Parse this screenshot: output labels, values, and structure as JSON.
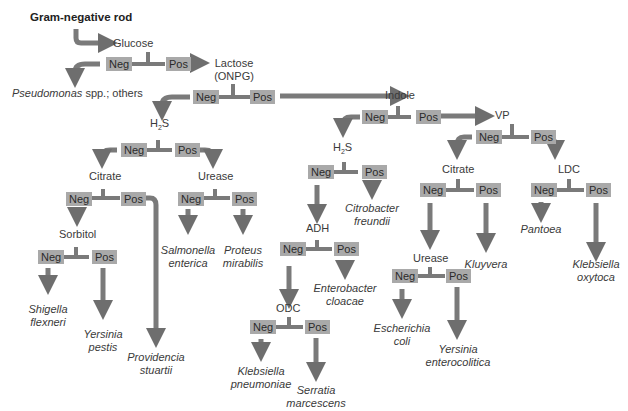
{
  "title": "Gram-negative rod",
  "colors": {
    "badge": "#a9a9a9",
    "arrow": "#6e6e6e",
    "text": "#3a3a3a"
  },
  "labels": {
    "neg": "Neg",
    "pos": "Pos"
  },
  "tests": {
    "glucose": "Glucose",
    "lactose1": "Lactose",
    "lactose2": "(ONPG)",
    "h2s_a": "H",
    "h2s_sub": "2",
    "h2s_b": "S",
    "citrate": "Citrate",
    "urease": "Urease",
    "sorbitol": "Sorbitol",
    "indole": "Indole",
    "vp": "VP",
    "adh": "ADH",
    "odc": "ODC",
    "ldc": "LDC"
  },
  "outcomes": {
    "pseudomonas_italic": "Pseudomonas",
    "pseudomonas_rest": " spp.; others",
    "salmonella": [
      "Salmonella",
      "enterica"
    ],
    "proteus": [
      "Proteus",
      "mirabilis"
    ],
    "shigella": [
      "Shigella",
      "flexneri"
    ],
    "yersinia_pestis": [
      "Yersinia",
      "pestis"
    ],
    "providencia": [
      "Providencia",
      "stuartii"
    ],
    "citrobacter": [
      "Citrobacter",
      "freundii"
    ],
    "enterobacter": [
      "Enterobacter",
      "cloacae"
    ],
    "klebsiella_pn": [
      "Klebsiella",
      "pneumoniae"
    ],
    "serratia": [
      "Serratia",
      "marcescens"
    ],
    "escherichia": [
      "Escherichia",
      "coli"
    ],
    "yersinia_ent": [
      "Yersinia",
      "enterocolitica"
    ],
    "kluyvera": [
      "Kluyvera"
    ],
    "pantoea": [
      "Pantoea"
    ],
    "klebsiella_ox": [
      "Klebsiella",
      "oxytoca"
    ]
  }
}
